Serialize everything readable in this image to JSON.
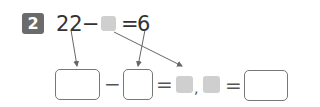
{
  "problem": {
    "number": "2",
    "equation": {
      "left": "22",
      "minus": "−",
      "equals": "=",
      "right": "6"
    }
  },
  "answer_row": {
    "minus": "−",
    "equals1": "=",
    "comma": ",",
    "equals2": "="
  },
  "colors": {
    "badge": "#6b6b6b",
    "placeholder_square": "#cfcfcf",
    "box_border": "#777777",
    "arrow": "#666666"
  }
}
